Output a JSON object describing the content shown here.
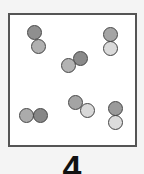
{
  "figure": {
    "label": "4",
    "colors": {
      "dark": "#8a8a8a",
      "medium": "#a9a9a9",
      "light": "#d6d6d6",
      "outline": "#444444",
      "frame": "#555555"
    }
  },
  "molecules": [
    {
      "id": 1,
      "atoms": [
        {
          "x": 27,
          "y": 25,
          "shade": "#8f8f8f"
        },
        {
          "x": 31,
          "y": 39,
          "shade": "#b0b0b0"
        }
      ]
    },
    {
      "id": 2,
      "atoms": [
        {
          "x": 73,
          "y": 51,
          "shade": "#8a8a8a"
        },
        {
          "x": 61,
          "y": 58,
          "shade": "#b3b3b3"
        }
      ]
    },
    {
      "id": 3,
      "atoms": [
        {
          "x": 103,
          "y": 27,
          "shade": "#a5a5a5"
        },
        {
          "x": 103,
          "y": 41,
          "shade": "#dadada"
        }
      ]
    },
    {
      "id": 4,
      "atoms": [
        {
          "x": 19,
          "y": 108,
          "shade": "#ababab"
        },
        {
          "x": 33,
          "y": 108,
          "shade": "#878787"
        }
      ]
    },
    {
      "id": 5,
      "atoms": [
        {
          "x": 68,
          "y": 95,
          "shade": "#a4a4a4"
        },
        {
          "x": 80,
          "y": 103,
          "shade": "#d8d8d8"
        }
      ]
    },
    {
      "id": 6,
      "atoms": [
        {
          "x": 108,
          "y": 101,
          "shade": "#9a9a9a"
        },
        {
          "x": 108,
          "y": 115,
          "shade": "#dcdcdc"
        }
      ]
    }
  ]
}
